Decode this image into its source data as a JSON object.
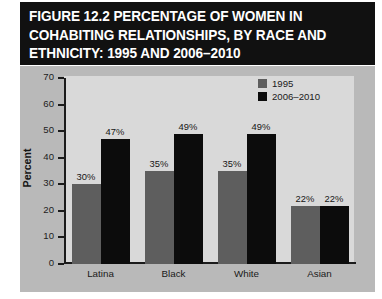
{
  "figure": {
    "title_lines": [
      "FIGURE 12.2   PERCENTAGE OF WOMEN IN",
      "COHABITING RELATIONSHIPS, BY RACE AND",
      "ETHNICITY: 1995 AND 2006–2010"
    ]
  },
  "legend": {
    "position": "top-right",
    "items": [
      {
        "label": "1995",
        "color": "#5e5e5e"
      },
      {
        "label": "2006–2010",
        "color": "#0c0c0c"
      }
    ]
  },
  "axis": {
    "y_title": "Percent",
    "y_ticks": [
      "70",
      "60",
      "50",
      "40",
      "30",
      "20",
      "10",
      "0"
    ],
    "x_categories": [
      "Latina",
      "Black",
      "White",
      "Asian"
    ]
  },
  "bar_labels": {
    "latina_1995": "30%",
    "latina_2006": "47%",
    "black_1995": "35%",
    "black_2006": "49%",
    "white_1995": "35%",
    "white_2006": "49%",
    "asian_1995": "22%",
    "asian_2006": "22%"
  },
  "colors": {
    "title_bg": "#111111",
    "title_text": "#ffffff",
    "panel_bg": "#b9b9b9",
    "plot_bg": "#d9d9d9",
    "axis": "#1b1b1b",
    "series_1995": "#5e5e5e",
    "series_2006": "#0c0c0c"
  },
  "chart_data": {
    "type": "bar",
    "title": "FIGURE 12.2   PERCENTAGE OF WOMEN IN COHABITING RELATIONSHIPS, BY RACE AND ETHNICITY: 1995 AND 2006–2010",
    "xlabel": "",
    "ylabel": "Percent",
    "ylim": [
      0,
      70
    ],
    "ytick_step": 10,
    "grid": false,
    "legend_position": "upper right",
    "categories": [
      "Latina",
      "Black",
      "White",
      "Asian"
    ],
    "series": [
      {
        "name": "1995",
        "color": "#5e5e5e",
        "values": [
          30,
          35,
          35,
          22
        ],
        "data_labels": [
          "30%",
          "35%",
          "35%",
          "22%"
        ]
      },
      {
        "name": "2006–2010",
        "color": "#0c0c0c",
        "values": [
          47,
          49,
          49,
          22
        ],
        "data_labels": [
          "47%",
          "49%",
          "49%",
          "22%"
        ]
      }
    ]
  }
}
